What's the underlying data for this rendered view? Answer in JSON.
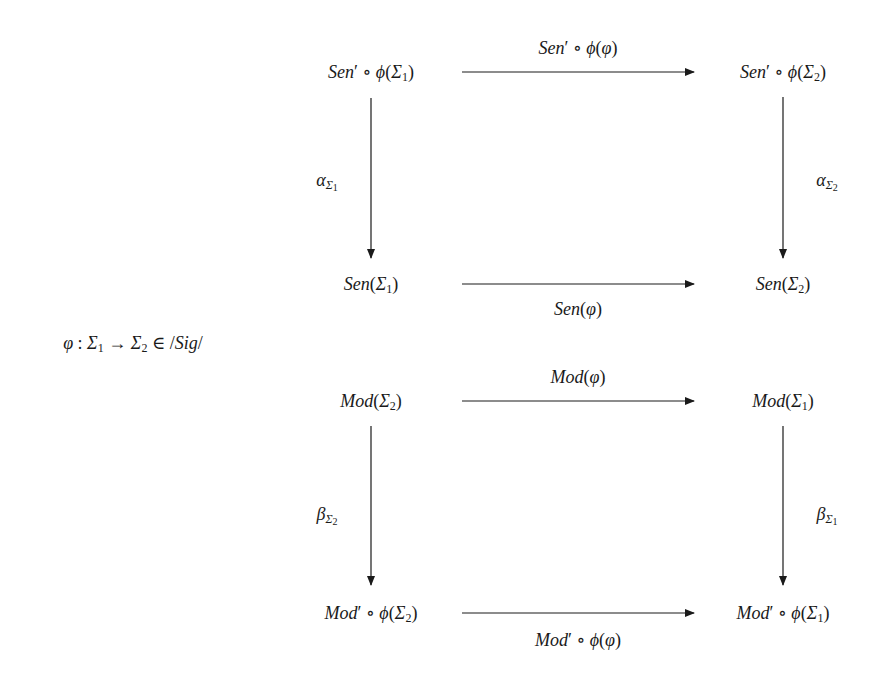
{
  "diagram": {
    "type": "commutative-diagram",
    "premise": {
      "text": "φ : Σ1 → Σ2 ∈ /Sig/",
      "phi": "φ",
      "colon": " : ",
      "sigma": "Σ",
      "sub1": "1",
      "sub2": "2",
      "to": " → ",
      "in": " ∈ /",
      "sig": "Sig",
      "slash": "/"
    },
    "square_top": {
      "nodes": {
        "top_left": {
          "text": "Sen′ ∘ φ(Σ1)",
          "fn": "Sen",
          "prime": "′",
          "compose": " ∘ ",
          "phi": "ϕ",
          "open": "(",
          "sigma": "Σ",
          "sub": "1",
          "close": ")"
        },
        "top_right": {
          "text": "Sen′ ∘ φ(Σ2)",
          "fn": "Sen",
          "prime": "′",
          "compose": " ∘ ",
          "phi": "ϕ",
          "open": "(",
          "sigma": "Σ",
          "sub": "2",
          "close": ")"
        },
        "bottom_left": {
          "text": "Sen(Σ1)",
          "fn": "Sen",
          "open": "(",
          "sigma": "Σ",
          "sub": "1",
          "close": ")"
        },
        "bottom_right": {
          "text": "Sen(Σ2)",
          "fn": "Sen",
          "open": "(",
          "sigma": "Σ",
          "sub": "2",
          "close": ")"
        }
      },
      "arrows": {
        "top": {
          "label": "Sen′ ∘ φ(φ)",
          "fn": "Sen",
          "prime": "′",
          "compose": " ∘ ",
          "phi": "ϕ",
          "open": "(",
          "arg": "φ",
          "close": ")"
        },
        "bottom": {
          "label": "Sen(φ)",
          "fn": "Sen",
          "open": "(",
          "arg": "φ",
          "close": ")"
        },
        "left": {
          "label": "α_Σ1",
          "greek": "α",
          "sigma": "Σ",
          "sub": "1"
        },
        "right": {
          "label": "α_Σ2",
          "greek": "α",
          "sigma": "Σ",
          "sub": "2"
        }
      }
    },
    "square_bottom": {
      "nodes": {
        "top_left": {
          "text": "Mod(Σ2)",
          "fn": "Mod",
          "open": "(",
          "sigma": "Σ",
          "sub": "2",
          "close": ")"
        },
        "top_right": {
          "text": "Mod(Σ1)",
          "fn": "Mod",
          "open": "(",
          "sigma": "Σ",
          "sub": "1",
          "close": ")"
        },
        "bottom_left": {
          "text": "Mod′ ∘ φ(Σ2)",
          "fn": "Mod",
          "prime": "′",
          "compose": " ∘ ",
          "phi": "ϕ",
          "open": "(",
          "sigma": "Σ",
          "sub": "2",
          "close": ")"
        },
        "bottom_right": {
          "text": "Mod′ ∘ φ(Σ1)",
          "fn": "Mod",
          "prime": "′",
          "compose": " ∘ ",
          "phi": "ϕ",
          "open": "(",
          "sigma": "Σ",
          "sub": "1",
          "close": ")"
        }
      },
      "arrows": {
        "top": {
          "label": "Mod(φ)",
          "fn": "Mod",
          "open": "(",
          "arg": "φ",
          "close": ")"
        },
        "bottom": {
          "label": "Mod′ ∘ φ(φ)",
          "fn": "Mod",
          "prime": "′",
          "compose": " ∘ ",
          "phi": "ϕ",
          "open": "(",
          "arg": "φ",
          "close": ")"
        },
        "left": {
          "label": "β_Σ2",
          "greek": "β",
          "sigma": "Σ",
          "sub": "2"
        },
        "right": {
          "label": "β_Σ1",
          "greek": "β",
          "sigma": "Σ",
          "sub": "1"
        }
      }
    },
    "colors": {
      "ink": "#1a1a1a",
      "background": "#ffffff"
    }
  }
}
